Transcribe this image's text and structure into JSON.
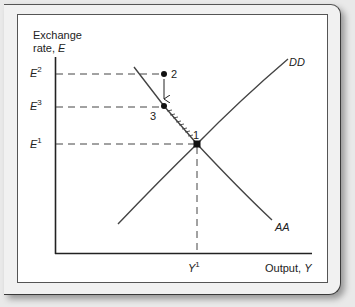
{
  "diagram": {
    "y_axis_label_line1": "Exchange",
    "y_axis_label_line2_prefix": "rate, ",
    "y_axis_label_var": "E",
    "x_axis_label_prefix": "Output, ",
    "x_axis_label_var": "Y",
    "y_ticks": [
      {
        "base": "E",
        "sup": "2"
      },
      {
        "base": "E",
        "sup": "3"
      },
      {
        "base": "E",
        "sup": "1"
      }
    ],
    "x_ticks": [
      {
        "base": "Y",
        "sup": "1"
      }
    ],
    "curves": {
      "dd_label": "DD",
      "aa_label": "AA"
    },
    "points": {
      "p1": "1",
      "p2": "2",
      "p3": "3"
    }
  }
}
